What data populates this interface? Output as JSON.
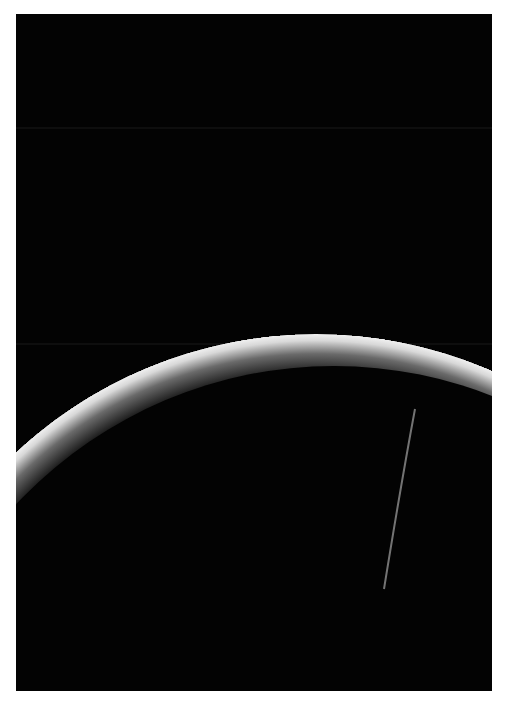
{
  "image": {
    "subject": "planet crescent in space",
    "description": "Thin bright crescent of a planet's limb arcing across a black sky, with a faint diagonal streak near the lower right",
    "colors": {
      "background_border": "#ffffff",
      "sky": "#030303",
      "crescent_bright": "#e8e8e8",
      "streak": "#9a9a9a"
    }
  }
}
